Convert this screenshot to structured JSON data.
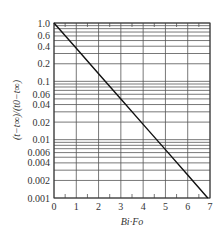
{
  "chart_data": {
    "type": "line",
    "title": "",
    "xlabel": "Bi·Fo",
    "ylabel": "(t−t∞)/(t0−t∞)",
    "xlim": [
      0,
      7
    ],
    "ylim": [
      0.001,
      1.0
    ],
    "yscale": "log",
    "grid": true,
    "x_ticks": [
      0,
      1,
      2,
      3,
      4,
      5,
      6,
      7
    ],
    "x_tick_labels": [
      "0",
      "1",
      "2",
      "3",
      "4",
      "5",
      "6",
      "7"
    ],
    "y_ticks": [
      1.0,
      0.6,
      0.4,
      0.2,
      0.1,
      0.06,
      0.04,
      0.02,
      0.01,
      0.006,
      0.004,
      0.002,
      0.001
    ],
    "y_tick_labels": [
      "1.0",
      "0.6",
      "0.4",
      "0.2",
      "0.1",
      "0.06",
      "0.04",
      "0.02",
      "0.01",
      "0.006",
      "0.004",
      "0.002",
      "0.001"
    ],
    "y_gridlines": [
      1.0,
      0.9,
      0.8,
      0.7,
      0.6,
      0.5,
      0.4,
      0.3,
      0.2,
      0.1,
      0.09,
      0.08,
      0.07,
      0.06,
      0.05,
      0.04,
      0.03,
      0.02,
      0.01,
      0.009,
      0.008,
      0.007,
      0.006,
      0.005,
      0.004,
      0.003,
      0.002,
      0.001
    ],
    "series": [
      {
        "name": "exp(-Bi·Fo)",
        "x": [
          0,
          1,
          2,
          3,
          4,
          5,
          6,
          6.9
        ],
        "y": [
          1.0,
          0.368,
          0.135,
          0.0498,
          0.0183,
          0.00674,
          0.00248,
          0.001
        ]
      }
    ],
    "legend": null
  },
  "colors": {
    "grid": "#555555",
    "line": "#111111",
    "text": "#333333"
  }
}
